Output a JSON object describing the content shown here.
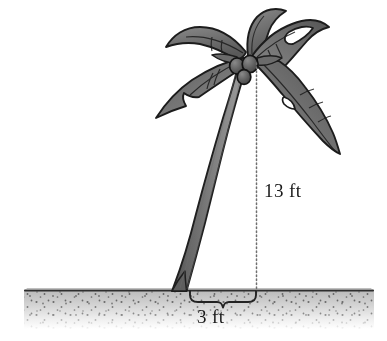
{
  "figure": {
    "name": "palm-tree-dimension-diagram",
    "background_color": "#ffffff"
  },
  "labels": {
    "height": "13 ft",
    "width": "3 ft"
  },
  "colors": {
    "outline": "#1a1a1a",
    "frond_fill": "#6e6e6e",
    "frond_fill_light": "#8d8d8d",
    "frond_fill_dark": "#4f4f4f",
    "coconut_fill": "#5a5a5a",
    "trunk_dark": "#565656",
    "trunk_light": "#9a9a9a",
    "ground_top": "#b8b8b8",
    "ground_bottom": "#ffffff",
    "ground_line": "#3a3a3a",
    "stipple": "#4a4a4a",
    "guide_line": "#7a7a7a",
    "text": "#1a1a1a"
  },
  "annotations": {
    "height_guide": {
      "name": "dotted-height-line",
      "style": "dotted",
      "x": 256,
      "y_top": 63,
      "y_bottom": 294,
      "value": "13 ft"
    },
    "width_brace": {
      "name": "curly-brace-width",
      "x_left": 190,
      "x_right": 256,
      "y": 291,
      "value": "3 ft"
    }
  },
  "geometry": {
    "ground": {
      "x_left": 24,
      "x_right": 374,
      "y_top": 290,
      "y_bottom": 330
    },
    "trunk": {
      "top_x": 243,
      "top_y": 60,
      "base_left_x": 172,
      "base_right_x": 209,
      "base_y": 291
    },
    "crown_center": {
      "x": 248,
      "y": 62
    },
    "coconuts": [
      {
        "cx": 237,
        "cy": 66,
        "r": 7
      },
      {
        "cx": 249,
        "cy": 63,
        "r": 7.5
      },
      {
        "cx": 244,
        "cy": 76,
        "r": 6.5
      }
    ]
  }
}
